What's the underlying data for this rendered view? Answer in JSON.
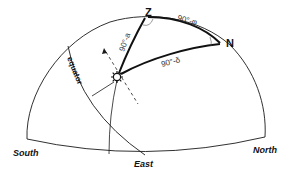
{
  "diagram": {
    "title": "",
    "points": {
      "zenith": "Z",
      "north_pole": "N",
      "sun_icon": "sun"
    },
    "arc_labels": {
      "zenith_to_pole": "90°-φ",
      "zenith_to_sun": "90°-a",
      "pole_to_sun": "90°-δ"
    },
    "great_circle_label": "equator",
    "horizon_labels": {
      "south": "South",
      "east": "East",
      "north": "North"
    },
    "colors": {
      "line": "#1a1a1a",
      "background": "#ffffff"
    }
  }
}
